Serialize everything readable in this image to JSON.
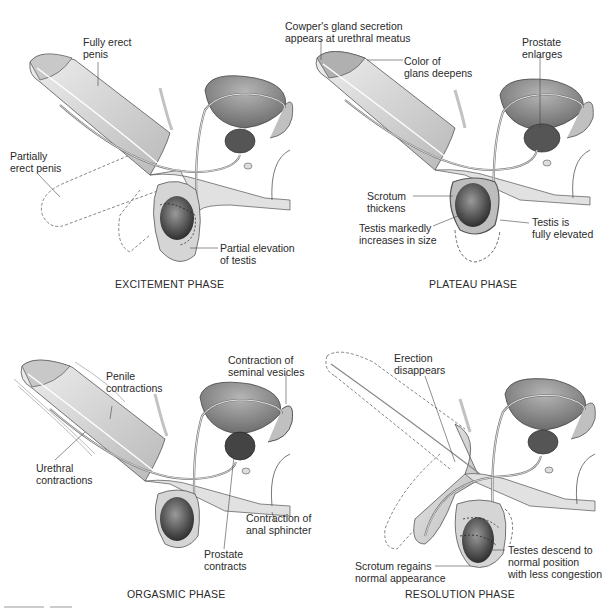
{
  "panels": {
    "excitement": {
      "title": "EXCITEMENT PHASE",
      "labels": {
        "fully_erect": [
          "Fully erect",
          "penis"
        ],
        "partially_erect": [
          "Partially",
          "erect penis"
        ],
        "partial_elevation": [
          "Partial elevation",
          "of testis"
        ]
      }
    },
    "plateau": {
      "title": "PLATEAU PHASE",
      "labels": {
        "cowpers": [
          "Cowper's gland secretion",
          "appears at urethral meatus"
        ],
        "glans_color": [
          "Color of",
          "glans deepens"
        ],
        "prostate": [
          "Prostate",
          "enlarges"
        ],
        "scrotum": [
          "Scrotum",
          "thickens"
        ],
        "testis_size": [
          "Testis markedly",
          "increases in size"
        ],
        "testis_elevated": [
          "Testis is",
          "fully elevated"
        ]
      }
    },
    "orgasmic": {
      "title": "ORGASMIC PHASE",
      "labels": {
        "penile": [
          "Penile",
          "contractions"
        ],
        "seminal": [
          "Contraction of",
          "seminal vesicles"
        ],
        "urethral": [
          "Urethral",
          "contractions"
        ],
        "anal": [
          "Contraction of",
          "anal sphincter"
        ],
        "prostate": [
          "Prostate",
          "contracts"
        ]
      }
    },
    "resolution": {
      "title": "RESOLUTION PHASE",
      "labels": {
        "erection": [
          "Erection",
          "disappears"
        ],
        "scrotum": [
          "Scrotum regains",
          "normal appearance"
        ],
        "testes": [
          "Testes descend to",
          "normal position",
          "with less congestion"
        ]
      }
    }
  },
  "colors": {
    "skin": "#d9d9d9",
    "skin_shadow": "#a9a9a9",
    "organ_dark": "#6e6e6e",
    "outline": "#555555",
    "text": "#2a2a2a"
  }
}
